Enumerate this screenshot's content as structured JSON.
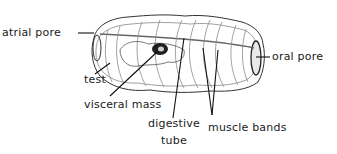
{
  "diagram": {
    "labels": {
      "atrial_pore": "atrial pore",
      "oral_pore": "oral pore",
      "test": "test",
      "visceral_mass": "visceral mass",
      "digestive_tube_line1": "digestive",
      "digestive_tube_line2": "tube",
      "muscle_bands": "muscle bands"
    },
    "colors": {
      "outline": "#333333",
      "detail": "#8a8a8a",
      "leader": "#111111",
      "viscera": "#222222"
    }
  }
}
